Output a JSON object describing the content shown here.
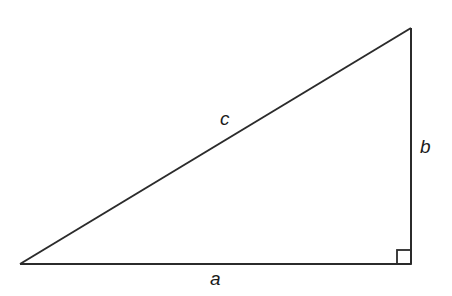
{
  "diagram": {
    "type": "right-triangle",
    "stroke_color": "#2b2b2b",
    "vertices": {
      "bottom_left": [
        20,
        264
      ],
      "right_angle": [
        411,
        264
      ],
      "top": [
        411,
        28
      ]
    },
    "right_angle_marker_size": 14,
    "labels": {
      "hypotenuse": "c",
      "vertical_leg": "b",
      "horizontal_leg": "a"
    }
  }
}
